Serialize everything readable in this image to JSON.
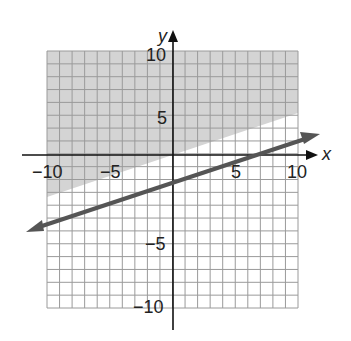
{
  "chart_data": {
    "type": "line",
    "title": "",
    "xlabel": "x",
    "ylabel": "y",
    "xlim": [
      -10,
      10
    ],
    "ylim": [
      -10,
      10
    ],
    "grid": true,
    "grid_step": 1,
    "x_tick_labels": [
      "-10",
      "-5",
      "5",
      "10"
    ],
    "y_tick_labels": [
      "10",
      "5",
      "-5",
      "-10"
    ],
    "series": [
      {
        "name": "boundary line",
        "style": "solid",
        "equation": "y = x/3",
        "x": [
          -11.8,
          0,
          11.7
        ],
        "y": [
          -3.9,
          0,
          3.9
        ],
        "arrows": "both"
      }
    ],
    "shaded_region": {
      "description": "region above the line (y >= x/3) shaded gray",
      "inequality": "y >= x/3"
    },
    "colors": {
      "shade": "#d4d4d4",
      "grid": "#9a9a9a",
      "line": "#555555",
      "axis": "#111111"
    }
  }
}
